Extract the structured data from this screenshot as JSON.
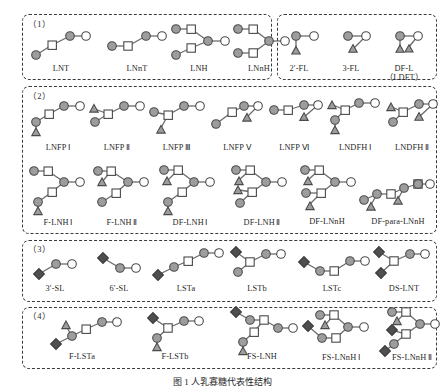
{
  "figure": {
    "caption": "图 1    人乳寡糖代表性结构",
    "symbol_colors": {
      "gal_fill": "#9d9d9d",
      "glc_fill": "#ffffff",
      "glcnac_fill": "#ffffff",
      "fuc_fill": "#9d9d9d",
      "neu5ac_fill": "#4f4f4f",
      "stroke": "#4a4a4a",
      "bond": "#6b6b6b",
      "box_border": "#3a3a3a",
      "background": "#ffffff"
    }
  },
  "groups": [
    {
      "id": "group-1a",
      "number": "（1）",
      "items": [
        {
          "label": "LNT",
          "roman": ""
        },
        {
          "label": "LNnT",
          "roman": ""
        },
        {
          "label": "LNH",
          "roman": ""
        },
        {
          "label": "LNnH",
          "roman": ""
        }
      ]
    },
    {
      "id": "group-1b",
      "number": "",
      "items": [
        {
          "label": "2′-FL",
          "roman": "",
          "sub": ""
        },
        {
          "label": "3-FL",
          "roman": "",
          "sub": ""
        },
        {
          "label": "DF-L",
          "roman": "",
          "sub": "（LDFT）"
        }
      ]
    },
    {
      "id": "group-2",
      "number": "（2）",
      "items": [
        {
          "label": "LNFP",
          "roman": "Ⅰ"
        },
        {
          "label": "LNFP",
          "roman": "Ⅱ"
        },
        {
          "label": "LNFP",
          "roman": "Ⅲ"
        },
        {
          "label": "LNFP",
          "roman": "Ⅴ"
        },
        {
          "label": "LNFP",
          "roman": "Ⅵ"
        },
        {
          "label": "LNDFH",
          "roman": "Ⅰ"
        },
        {
          "label": "LNDFH",
          "roman": "Ⅱ"
        },
        {
          "label": "F-LNH",
          "roman": "Ⅰ"
        },
        {
          "label": "F-LNH",
          "roman": "Ⅱ"
        },
        {
          "label": "DF-LNH",
          "roman": "Ⅰ"
        },
        {
          "label": "DF-LNH",
          "roman": "Ⅱ"
        },
        {
          "label": "DF-LNnH",
          "roman": ""
        },
        {
          "label": "DF-para-LNnH",
          "roman": ""
        }
      ]
    },
    {
      "id": "group-3",
      "number": "（3）",
      "items": [
        {
          "label": "3′-SL",
          "roman": ""
        },
        {
          "label": "6′-SL",
          "roman": ""
        },
        {
          "label": "LSTa",
          "roman": ""
        },
        {
          "label": "LSTb",
          "roman": ""
        },
        {
          "label": "LSTc",
          "roman": ""
        },
        {
          "label": "DS-LNT",
          "roman": ""
        }
      ]
    },
    {
      "id": "group-4",
      "number": "（4）",
      "items": [
        {
          "label": "F-LSTa",
          "roman": ""
        },
        {
          "label": "F-LSTb",
          "roman": ""
        },
        {
          "label": "FS-LNH",
          "roman": ""
        },
        {
          "label": "FS-LNnH",
          "roman": "Ⅰ"
        },
        {
          "label": "FS-LNnH",
          "roman": "Ⅱ"
        }
      ]
    }
  ]
}
